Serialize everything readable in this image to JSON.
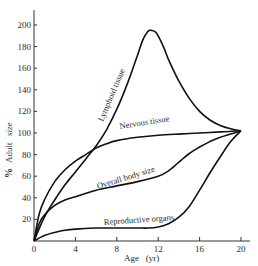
{
  "chart_data": {
    "type": "line",
    "title": "",
    "xlabel": "Age (yr)",
    "ylabel": "% Adult size",
    "xlim": [
      0,
      20
    ],
    "ylim": [
      0,
      210
    ],
    "grid": false,
    "legend": "inline labels on curves",
    "x_ticks": [
      0,
      4,
      8,
      12,
      16,
      20
    ],
    "y_ticks": [
      20,
      40,
      60,
      80,
      100,
      120,
      140,
      160,
      180,
      200
    ],
    "series": [
      {
        "name": "Lymphoid tissue",
        "x": [
          0,
          1,
          2,
          3,
          4,
          5,
          6,
          7,
          8,
          9,
          10,
          10.5,
          11,
          11.3,
          11.8,
          12.5,
          13,
          14,
          15,
          16,
          17,
          18,
          19,
          20
        ],
        "y": [
          0,
          22,
          38,
          52,
          64,
          76,
          88,
          103,
          122,
          145,
          172,
          186,
          194,
          195,
          193,
          180,
          168,
          148,
          132,
          120,
          112,
          107,
          104,
          102
        ]
      },
      {
        "name": "Nervous tissue",
        "x": [
          0,
          0.5,
          1,
          2,
          3,
          4,
          5,
          6,
          7,
          8,
          10,
          12,
          14,
          16,
          18,
          20
        ],
        "y": [
          0,
          25,
          38,
          55,
          66,
          74,
          80,
          86,
          90,
          93,
          96,
          98,
          99,
          100,
          101,
          102
        ]
      },
      {
        "name": "Overall body size",
        "x": [
          0,
          0.5,
          1,
          2,
          3,
          4,
          6,
          8,
          10,
          12,
          13,
          14,
          15,
          16,
          17,
          18,
          19,
          20
        ],
        "y": [
          0,
          16,
          24,
          33,
          38,
          41,
          47,
          51,
          55,
          60,
          65,
          73,
          81,
          87,
          92,
          96,
          99,
          102
        ]
      },
      {
        "name": "Reproductive organs",
        "x": [
          0,
          1,
          2,
          3,
          4,
          6,
          8,
          10,
          11,
          12,
          13,
          14,
          15,
          16,
          17,
          18,
          19,
          20
        ],
        "y": [
          0,
          5,
          8,
          10,
          11,
          12,
          12,
          12,
          12,
          13,
          16,
          22,
          32,
          47,
          63,
          78,
          92,
          102
        ]
      }
    ],
    "annotations": [
      {
        "text": "Lymphoid tissue",
        "near_x": 8.2,
        "near_y": 125,
        "rotation_deg": -68
      },
      {
        "text": "Nervous tissue",
        "near_x": 10,
        "near_y": 100,
        "rotation_deg": -8
      },
      {
        "text": "Overall body size",
        "near_x": 8.5,
        "near_y": 60,
        "rotation_deg": -18
      },
      {
        "text": "Reproductive organs",
        "near_x": 10.5,
        "near_y": 18,
        "rotation_deg": -4
      }
    ]
  },
  "labels": {
    "x_axis": "Age   (yr)",
    "y_axis_pct": "%",
    "y_axis_adult": "Adult",
    "y_axis_size": "size",
    "lymphoid": "Lymphoid tissue",
    "nervous": "Nervous tissue",
    "body": "Overall body size",
    "reproductive": "Reproductive organs"
  },
  "layout": {
    "origin_px": [
      34,
      241
    ],
    "px_per_year": 10.35,
    "px_per_unit": 1.08,
    "curve_color": "#111111",
    "axis_color": "#333333"
  }
}
